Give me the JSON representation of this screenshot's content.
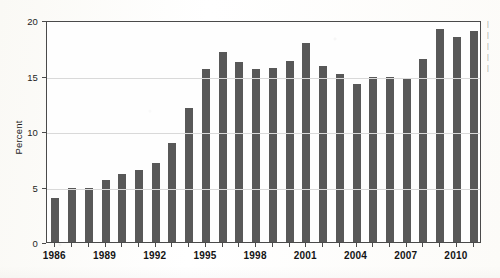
{
  "chart_data": {
    "type": "bar",
    "title": "",
    "subtitle": "",
    "xlabel": "",
    "ylabel": "Percent",
    "ylim": [
      0,
      20
    ],
    "xlim_categories": [
      "1986",
      "2011"
    ],
    "grid": true,
    "gridlines_y": [
      0,
      5,
      10,
      15,
      20
    ],
    "ytick_labels": [
      "0",
      "5",
      "10",
      "15",
      "20"
    ],
    "xtick_labels": [
      "1986",
      "1989",
      "1992",
      "1995",
      "1998",
      "2001",
      "2004",
      "2007",
      "2010"
    ],
    "xtick_interval_years": 3,
    "legend": [],
    "bar_color": "#585858",
    "categories": [
      "1986",
      "1987",
      "1988",
      "1989",
      "1990",
      "1991",
      "1992",
      "1993",
      "1994",
      "1995",
      "1996",
      "1997",
      "1998",
      "1999",
      "2000",
      "2001",
      "2002",
      "2003",
      "2004",
      "2005",
      "2006",
      "2007",
      "2008",
      "2009",
      "2010",
      "2011"
    ],
    "values": [
      4.0,
      4.9,
      4.85,
      5.6,
      6.1,
      6.5,
      7.1,
      8.9,
      12.1,
      15.6,
      17.1,
      16.2,
      15.6,
      15.7,
      16.3,
      17.9,
      15.9,
      15.1,
      14.2,
      14.9,
      14.9,
      14.8,
      16.5,
      19.2,
      18.5,
      19.0
    ],
    "series": [
      {
        "name": "Percent",
        "values": [
          4.0,
          4.9,
          4.85,
          5.6,
          6.1,
          6.5,
          7.1,
          8.9,
          12.1,
          15.6,
          17.1,
          16.2,
          15.6,
          15.7,
          16.3,
          17.9,
          15.9,
          15.1,
          14.2,
          14.9,
          14.9,
          14.8,
          16.5,
          19.2,
          18.5,
          19.0
        ]
      }
    ],
    "annotations": []
  },
  "edge_caption_fragments": [
    "|",
    "|",
    "|",
    "|",
    "|"
  ]
}
